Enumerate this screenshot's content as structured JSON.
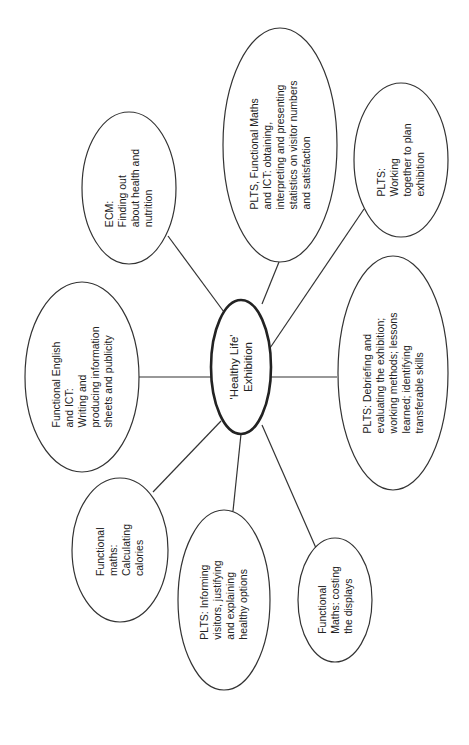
{
  "diagram": {
    "type": "mind-map",
    "orientation": "rotated-90-ccw",
    "center": {
      "id": "center",
      "label": "'Healthy Life'\nExhibition",
      "cx": 241,
      "cy": 367,
      "rx": 30,
      "ry": 67
    },
    "nodes": [
      {
        "id": "ecm",
        "label": "ECM:\nFinding out\nabout health and\nnutrition",
        "cx": 129,
        "cy": 188,
        "rx": 47,
        "ry": 76,
        "edge_from": [
          168,
          236
        ],
        "edge_to": [
          224,
          312
        ]
      },
      {
        "id": "plts-maths-ict",
        "label": "PLTS, Functional Maths\nand ICT: obtaining,\ninterpreting and presenting\nstatistics on visitor numbers\nand satisfaction",
        "cx": 280,
        "cy": 145,
        "rx": 57,
        "ry": 117,
        "edge_from": [
          279,
          262
        ],
        "edge_to": [
          262,
          304
        ]
      },
      {
        "id": "plts-working",
        "label": "PLTS:\nWorking\ntogether to plan\nexhibition",
        "cx": 401,
        "cy": 160,
        "rx": 47,
        "ry": 77,
        "edge_from": [
          364,
          209
        ],
        "edge_to": [
          270,
          348
        ]
      },
      {
        "id": "plts-debriefing",
        "label": "PLTS: Debriefing and\nevaluating the exhibition;\nworking methods; lessons\nlearned; identifying\ntransferable skills",
        "cx": 393,
        "cy": 373,
        "rx": 55,
        "ry": 117,
        "edge_from": [
          337,
          377
        ],
        "edge_to": [
          271,
          377
        ]
      },
      {
        "id": "maths-costing",
        "label": "Functional\nMaths: costing\nthe displays",
        "cx": 335,
        "cy": 600,
        "rx": 37,
        "ry": 62,
        "edge_from": [
          316,
          548
        ],
        "edge_to": [
          262,
          425
        ]
      },
      {
        "id": "plts-informing",
        "label": "PLTS: Informing\nvisitors, justifying\nand explaining\nhealthy options",
        "cx": 224,
        "cy": 600,
        "rx": 46,
        "ry": 90,
        "edge_from": [
          233,
          511
        ],
        "edge_to": [
          241,
          434
        ]
      },
      {
        "id": "maths-calories",
        "label": "Functional\nmaths:\nCalculating\ncalories",
        "cx": 120,
        "cy": 550,
        "rx": 48,
        "ry": 72,
        "edge_from": [
          153,
          492
        ],
        "edge_to": [
          221,
          421
        ]
      },
      {
        "id": "english-ict",
        "label": "Functional English\nand ICT:\nWriting and\nproducing information\nsheets and publicity",
        "cx": 82,
        "cy": 377,
        "rx": 57,
        "ry": 95,
        "edge_from": [
          139,
          377
        ],
        "edge_to": [
          211,
          377
        ]
      }
    ],
    "colors": {
      "stroke": "#333333",
      "center_stroke": "#222222",
      "background": "#ffffff",
      "text": "#222222"
    }
  }
}
